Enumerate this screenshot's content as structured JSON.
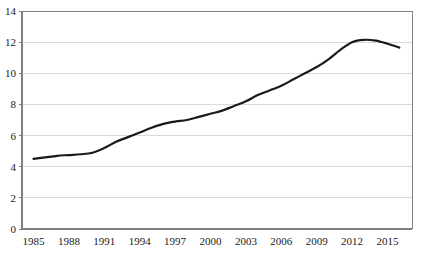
{
  "chart_data": {
    "type": "line",
    "title": "",
    "xlabel": "",
    "ylabel": "",
    "xlim": [
      1985,
      2016
    ],
    "ylim": [
      0,
      14
    ],
    "grid": true,
    "legend": false,
    "line_color": "#1a1a1a",
    "line_width": 2.2,
    "axis_color": "#808080",
    "grid_color": "#d9d9d9",
    "background": "#ffffff",
    "yticks": [
      0,
      2,
      4,
      6,
      8,
      10,
      12,
      14
    ],
    "ytick_labels": [
      "0",
      "2",
      "4",
      "6",
      "8",
      "10",
      "12",
      "14"
    ],
    "xticks": [
      1985,
      1988,
      1991,
      1994,
      1997,
      2000,
      2003,
      2006,
      2009,
      2012,
      2015
    ],
    "xtick_labels": [
      "1985",
      "1988",
      "1991",
      "1994",
      "1997",
      "2000",
      "2003",
      "2006",
      "2009",
      "2012",
      "2015"
    ],
    "x": [
      1985,
      1986,
      1987,
      1988,
      1989,
      1990,
      1991,
      1992,
      1993,
      1994,
      1995,
      1996,
      1997,
      1998,
      1999,
      2000,
      2001,
      2002,
      2003,
      2004,
      2005,
      2006,
      2007,
      2008,
      2009,
      2010,
      2011,
      2012,
      2013,
      2014,
      2015,
      2016
    ],
    "values": [
      4.5,
      4.6,
      4.7,
      4.75,
      4.8,
      4.9,
      5.2,
      5.6,
      5.9,
      6.2,
      6.5,
      6.75,
      6.9,
      7.0,
      7.2,
      7.4,
      7.6,
      7.9,
      8.2,
      8.6,
      8.9,
      9.2,
      9.6,
      10.0,
      10.4,
      10.9,
      11.5,
      12.0,
      12.15,
      12.1,
      11.9,
      11.65
    ],
    "series": [
      {
        "name": "series-1",
        "values": [
          4.5,
          4.6,
          4.7,
          4.75,
          4.8,
          4.9,
          5.2,
          5.6,
          5.9,
          6.2,
          6.5,
          6.75,
          6.9,
          7.0,
          7.2,
          7.4,
          7.6,
          7.9,
          8.2,
          8.6,
          8.9,
          9.2,
          9.6,
          10.0,
          10.4,
          10.9,
          11.5,
          12.0,
          12.15,
          12.1,
          11.9,
          11.65
        ]
      }
    ]
  }
}
